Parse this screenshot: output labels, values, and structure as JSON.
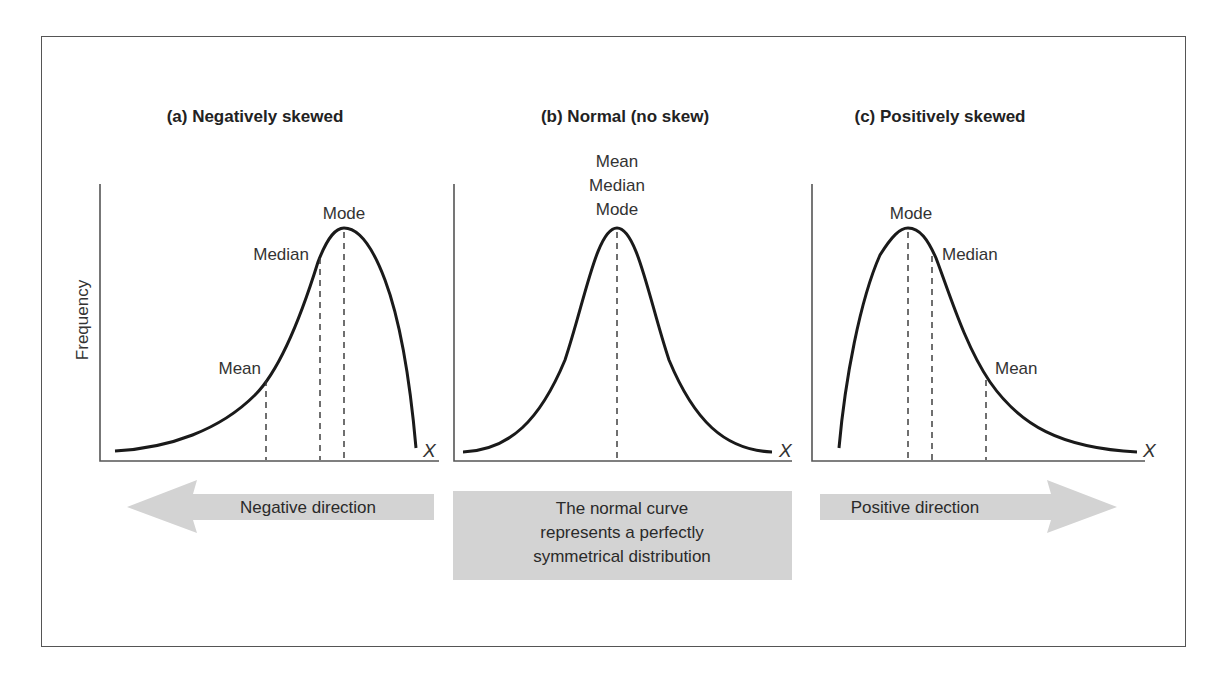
{
  "figure": {
    "y_axis_label": "Frequency",
    "x_axis_symbol": "X",
    "panels": [
      {
        "id": "a",
        "title": "(a) Negatively skewed",
        "labels": {
          "mean": "Mean",
          "median": "Median",
          "mode": "Mode"
        }
      },
      {
        "id": "b",
        "title": "(b) Normal (no skew)",
        "labels": {
          "mean": "Mean",
          "median": "Median",
          "mode": "Mode"
        }
      },
      {
        "id": "c",
        "title": "(c) Positively skewed",
        "labels": {
          "mean": "Mean",
          "median": "Median",
          "mode": "Mode"
        }
      }
    ],
    "bottom": {
      "negative_arrow": "Negative direction",
      "center_box_lines": [
        "The normal curve",
        "represents a perfectly",
        "symmetrical distribution"
      ],
      "positive_arrow": "Positive direction"
    },
    "colors": {
      "curve": "#1a1a1a",
      "axis": "#555555",
      "arrow_fill": "#d3d3d3",
      "frame": "#555555"
    }
  }
}
